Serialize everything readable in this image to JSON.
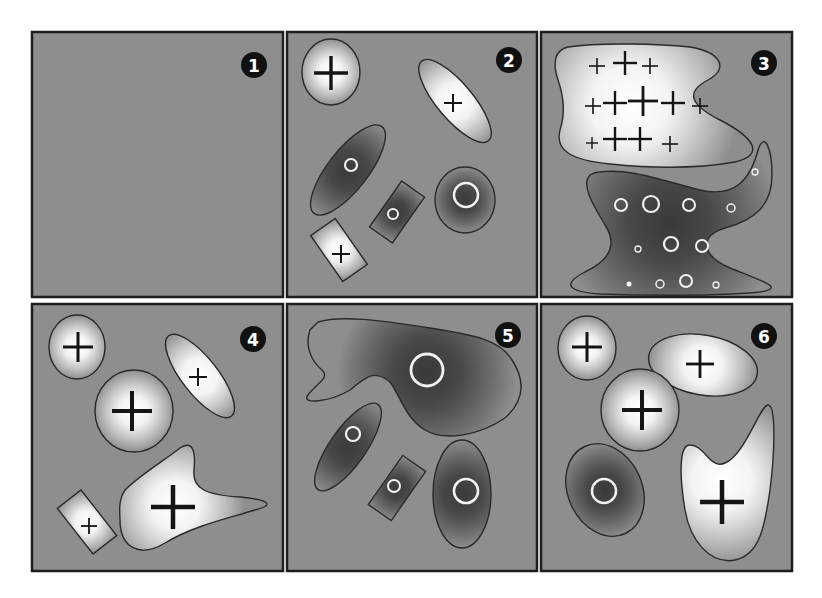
{
  "figure": {
    "width": 822,
    "height": 598,
    "background": "#ffffff",
    "panel_fill": "#8e8e8e",
    "panel_border": "#1e1e1e",
    "light_center": "#ffffff",
    "dark_center": "#3a3a3a"
  },
  "panels": [
    {
      "id": 1,
      "label": "1",
      "x": 32,
      "y": 32,
      "w": 251,
      "h": 265,
      "shapes": []
    },
    {
      "id": 2,
      "label": "2",
      "x": 287,
      "y": 32,
      "w": 250,
      "h": 265,
      "shapes": [
        {
          "kind": "ellipse",
          "tone": "light",
          "cx": 331,
          "cy": 72,
          "rx": 29,
          "ry": 33,
          "rot": 0,
          "marks": [
            {
              "type": "plus",
              "x": 331,
              "y": 73,
              "size": 17,
              "width": 3.4
            }
          ]
        },
        {
          "kind": "ellipse",
          "tone": "light",
          "cx": 455,
          "cy": 101,
          "rx": 52,
          "ry": 18,
          "rot": 50,
          "marks": [
            {
              "type": "plus",
              "x": 453,
              "y": 103,
              "size": 9,
              "width": 2
            }
          ]
        },
        {
          "kind": "ellipse",
          "tone": "dark",
          "cx": 348,
          "cy": 170,
          "rx": 55,
          "ry": 20,
          "rot": -52,
          "marks": [
            {
              "type": "ring",
              "x": 351,
              "y": 165,
              "r": 6,
              "width": 2.2
            }
          ]
        },
        {
          "kind": "ellipse",
          "tone": "dark",
          "cx": 465,
          "cy": 200,
          "rx": 30,
          "ry": 33,
          "rot": 0,
          "marks": [
            {
              "type": "ring",
              "x": 466,
              "y": 195,
              "r": 12,
              "width": 2.5
            }
          ]
        },
        {
          "kind": "rect",
          "tone": "dark",
          "cx": 397,
          "cy": 212,
          "w": 28,
          "h": 56,
          "rot": 35,
          "marks": [
            {
              "type": "ring",
              "x": 393,
              "y": 214,
              "r": 5,
              "width": 2
            }
          ]
        },
        {
          "kind": "rect",
          "tone": "light",
          "cx": 339,
          "cy": 250,
          "w": 30,
          "h": 56,
          "rot": -35,
          "marks": [
            {
              "type": "plus",
              "x": 341,
              "y": 254,
              "size": 9,
              "width": 2
            }
          ]
        }
      ]
    },
    {
      "id": 3,
      "label": "3",
      "x": 541,
      "y": 32,
      "w": 251,
      "h": 265,
      "shapes": [
        {
          "kind": "path",
          "tone": "light",
          "gx": 630,
          "gy": 105,
          "gr": 110,
          "d": "M568,47 C600,42 660,44 690,47 C720,52 730,68 708,80 C685,92 690,105 720,120 C755,138 765,155 735,162 C690,170 640,167 610,164 C570,160 555,150 560,130 C565,115 565,100 558,80 C552,62 555,50 568,47 Z",
          "marks": [
            {
              "type": "plus",
              "x": 597,
              "y": 66,
              "size": 8,
              "width": 1.6
            },
            {
              "type": "plus",
              "x": 625,
              "y": 63,
              "size": 12,
              "width": 2.4
            },
            {
              "type": "plus",
              "x": 650,
              "y": 66,
              "size": 8,
              "width": 1.6
            },
            {
              "type": "plus",
              "x": 593,
              "y": 106,
              "size": 8,
              "width": 1.6
            },
            {
              "type": "plus",
              "x": 615,
              "y": 103,
              "size": 12,
              "width": 2.4
            },
            {
              "type": "plus",
              "x": 643,
              "y": 101,
              "size": 15,
              "width": 2.8
            },
            {
              "type": "plus",
              "x": 673,
              "y": 103,
              "size": 12,
              "width": 2.4
            },
            {
              "type": "plus",
              "x": 700,
              "y": 106,
              "size": 8,
              "width": 1.6
            },
            {
              "type": "plus",
              "x": 592,
              "y": 143,
              "size": 6,
              "width": 1.4
            },
            {
              "type": "plus",
              "x": 615,
              "y": 139,
              "size": 12,
              "width": 2.4
            },
            {
              "type": "plus",
              "x": 640,
              "y": 139,
              "size": 12,
              "width": 2.4
            },
            {
              "type": "plus",
              "x": 670,
              "y": 144,
              "size": 8,
              "width": 1.6
            }
          ]
        },
        {
          "kind": "path",
          "tone": "dark",
          "gx": 670,
          "gy": 222,
          "gr": 110,
          "d": "M600,172 C630,168 660,180 700,190 C735,198 750,180 758,150 C765,130 772,150 772,175 C772,205 755,220 725,228 C700,235 700,255 730,268 C765,282 785,288 760,292 C720,296 650,296 600,294 C570,292 560,285 585,272 C615,258 615,240 605,225 C595,208 580,185 590,175 C593,173 596,172 600,172 Z",
          "marks": [
            {
              "type": "ring",
              "x": 755,
              "y": 172,
              "r": 3,
              "width": 1.3
            },
            {
              "type": "ring",
              "x": 621,
              "y": 205,
              "r": 6,
              "width": 2
            },
            {
              "type": "ring",
              "x": 651,
              "y": 204,
              "r": 8,
              "width": 2.2
            },
            {
              "type": "ring",
              "x": 689,
              "y": 205,
              "r": 6,
              "width": 2
            },
            {
              "type": "ring",
              "x": 731,
              "y": 208,
              "r": 4,
              "width": 1.5
            },
            {
              "type": "ring",
              "x": 638,
              "y": 249,
              "r": 3,
              "width": 1.3
            },
            {
              "type": "ring",
              "x": 671,
              "y": 244,
              "r": 7,
              "width": 2.2
            },
            {
              "type": "ring",
              "x": 702,
              "y": 246,
              "r": 6,
              "width": 2
            },
            {
              "type": "dot",
              "x": 629,
              "y": 284,
              "r": 2.5
            },
            {
              "type": "ring",
              "x": 660,
              "y": 284,
              "r": 4,
              "width": 1.5
            },
            {
              "type": "ring",
              "x": 686,
              "y": 281,
              "r": 6,
              "width": 2
            },
            {
              "type": "ring",
              "x": 716,
              "y": 285,
              "r": 3,
              "width": 1.3
            }
          ]
        }
      ]
    },
    {
      "id": 4,
      "label": "4",
      "x": 32,
      "y": 304,
      "w": 251,
      "h": 267,
      "shapes": [
        {
          "kind": "ellipse",
          "tone": "light",
          "cx": 77,
          "cy": 347,
          "rx": 28,
          "ry": 32,
          "rot": 0,
          "marks": [
            {
              "type": "plus",
              "x": 78,
              "y": 347,
              "size": 15,
              "width": 3
            }
          ]
        },
        {
          "kind": "ellipse",
          "tone": "light",
          "cx": 200,
          "cy": 376,
          "rx": 51,
          "ry": 18,
          "rot": 52,
          "marks": [
            {
              "type": "plus",
              "x": 198,
              "y": 377,
              "size": 9,
              "width": 2
            }
          ]
        },
        {
          "kind": "ellipse",
          "tone": "light",
          "cx": 134,
          "cy": 411,
          "rx": 39,
          "ry": 41,
          "rot": 0,
          "marks": [
            {
              "type": "plus",
              "x": 132,
              "y": 411,
              "size": 20,
              "width": 4
            }
          ]
        },
        {
          "kind": "path",
          "tone": "light",
          "gx": 175,
          "gy": 505,
          "gr": 70,
          "d": "M125,490 C140,475 165,460 180,448 C192,440 196,450 194,470 C192,488 205,495 240,497 C270,500 275,505 255,510 C230,518 195,525 165,543 C140,558 120,548 120,520 C119,505 120,497 125,490 Z",
          "marks": [
            {
              "type": "plus",
              "x": 173,
              "y": 507,
              "size": 22,
              "width": 4.5
            }
          ]
        },
        {
          "kind": "rect",
          "tone": "light",
          "cx": 87,
          "cy": 522,
          "w": 30,
          "h": 58,
          "rot": -38,
          "marks": [
            {
              "type": "plus",
              "x": 89,
              "y": 526,
              "size": 8,
              "width": 1.8
            }
          ]
        }
      ]
    },
    {
      "id": 5,
      "label": "5",
      "x": 287,
      "y": 304,
      "w": 250,
      "h": 267,
      "shapes": [
        {
          "kind": "path",
          "tone": "dark",
          "gx": 427,
          "gy": 372,
          "gr": 90,
          "d": "M318,322 C340,315 380,320 430,328 C475,335 500,340 512,360 C525,380 525,400 505,418 C480,435 445,442 425,430 C405,418 400,395 390,382 C375,370 368,375 350,390 C330,402 300,405 308,395 C318,382 330,378 322,370 C310,360 305,345 310,330 Z",
          "marks": [
            {
              "type": "ring",
              "x": 427,
              "y": 370,
              "r": 16,
              "width": 2.8
            }
          ]
        },
        {
          "kind": "ellipse",
          "tone": "dark",
          "cx": 348,
          "cy": 447,
          "rx": 52,
          "ry": 18,
          "rot": -55,
          "marks": [
            {
              "type": "ring",
              "x": 353,
              "y": 434,
              "r": 7,
              "width": 2.2
            }
          ]
        },
        {
          "kind": "rect",
          "tone": "dark",
          "cx": 397,
          "cy": 488,
          "w": 28,
          "h": 60,
          "rot": 35,
          "marks": [
            {
              "type": "ring",
              "x": 394,
              "y": 486,
              "r": 6,
              "width": 2
            }
          ]
        },
        {
          "kind": "ellipse",
          "tone": "dark",
          "cx": 462,
          "cy": 494,
          "rx": 29,
          "ry": 54,
          "rot": 0,
          "marks": [
            {
              "type": "ring",
              "x": 466,
              "y": 491,
              "r": 12,
              "width": 2.6
            }
          ]
        }
      ]
    },
    {
      "id": 6,
      "label": "6",
      "x": 541,
      "y": 304,
      "w": 251,
      "h": 267,
      "shapes": [
        {
          "kind": "ellipse",
          "tone": "light",
          "cx": 587,
          "cy": 348,
          "rx": 29,
          "ry": 32,
          "rot": 0,
          "marks": [
            {
              "type": "plus",
              "x": 587,
              "y": 347,
              "size": 15,
              "width": 3
            }
          ]
        },
        {
          "kind": "ellipse",
          "tone": "light",
          "cx": 703,
          "cy": 365,
          "rx": 55,
          "ry": 30,
          "rot": 10,
          "marks": [
            {
              "type": "plus",
              "x": 700,
              "y": 364,
              "size": 14,
              "width": 2.8
            }
          ]
        },
        {
          "kind": "ellipse",
          "tone": "light",
          "cx": 640,
          "cy": 410,
          "rx": 39,
          "ry": 41,
          "rot": 0,
          "marks": [
            {
              "type": "plus",
              "x": 642,
              "y": 410,
              "size": 20,
              "width": 4
            }
          ]
        },
        {
          "kind": "ellipse",
          "tone": "dark",
          "cx": 605,
          "cy": 490,
          "rx": 37,
          "ry": 48,
          "rot": -25,
          "marks": [
            {
              "type": "ring",
              "x": 604,
              "y": 491,
              "r": 12,
              "width": 2.5
            }
          ]
        },
        {
          "kind": "path",
          "tone": "light",
          "gx": 722,
          "gy": 480,
          "gr": 85,
          "d": "M690,445 C705,445 710,470 725,463 C745,455 760,405 768,405 C776,405 775,450 770,490 C765,525 760,555 735,560 C710,565 690,540 685,510 C680,480 678,445 690,445 Z",
          "marks": [
            {
              "type": "plus",
              "x": 722,
              "y": 502,
              "size": 22,
              "width": 4.5
            }
          ]
        }
      ]
    }
  ],
  "badges": [
    {
      "panel": 1,
      "label": "1",
      "x": 254,
      "y": 65,
      "r": 13
    },
    {
      "panel": 2,
      "label": "2",
      "x": 509,
      "y": 60,
      "r": 13
    },
    {
      "panel": 3,
      "label": "3",
      "x": 764,
      "y": 63,
      "r": 13
    },
    {
      "panel": 4,
      "label": "4",
      "x": 253,
      "y": 339,
      "r": 13
    },
    {
      "panel": 5,
      "label": "5",
      "x": 508,
      "y": 335,
      "r": 13
    },
    {
      "panel": 6,
      "label": "6",
      "x": 764,
      "y": 336,
      "r": 13
    }
  ]
}
